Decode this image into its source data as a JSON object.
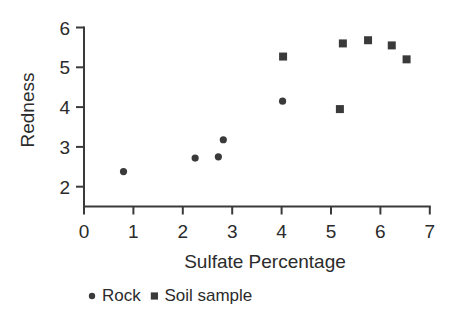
{
  "chart_data": {
    "type": "scatter",
    "title": "",
    "xlabel": "Sulfate Percentage",
    "ylabel": "Redness",
    "xlim": [
      0,
      7
    ],
    "ylim": [
      1.5,
      6
    ],
    "xticks": [
      0,
      1,
      2,
      3,
      4,
      5,
      6,
      7
    ],
    "xtick_labels": [
      "0",
      "1",
      "2",
      "3",
      "4",
      "5",
      "6",
      "7"
    ],
    "yticks": [
      2,
      3,
      4,
      5,
      6
    ],
    "ytick_labels": [
      "2",
      "3",
      "4",
      "5",
      "6"
    ],
    "grid": false,
    "legend_position": "below",
    "marker_color": "#3a3a3a",
    "axis_color": "#3a3a3a",
    "series": [
      {
        "name": "Rock",
        "marker": "circle",
        "color": "#3a3a3a",
        "points": [
          {
            "x": 0.8,
            "y": 2.38
          },
          {
            "x": 2.25,
            "y": 2.72
          },
          {
            "x": 2.72,
            "y": 2.75
          },
          {
            "x": 2.82,
            "y": 3.18
          },
          {
            "x": 4.02,
            "y": 4.15
          }
        ]
      },
      {
        "name": "Soil sample",
        "marker": "square",
        "color": "#3a3a3a",
        "points": [
          {
            "x": 4.03,
            "y": 5.27
          },
          {
            "x": 5.18,
            "y": 3.95
          },
          {
            "x": 5.24,
            "y": 5.6
          },
          {
            "x": 5.75,
            "y": 5.68
          },
          {
            "x": 6.23,
            "y": 5.55
          },
          {
            "x": 6.53,
            "y": 5.2
          }
        ]
      }
    ]
  },
  "legend": {
    "entries": [
      {
        "label": "Rock",
        "marker": "circle"
      },
      {
        "label": "Soil sample",
        "marker": "square"
      }
    ]
  }
}
